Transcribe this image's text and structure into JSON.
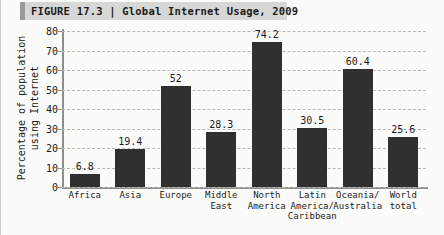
{
  "figure": {
    "title": "FIGURE 17.3 | Global Internet Usage, 2009",
    "title_label": "FIGURE 17.3",
    "title_separator": "|",
    "title_name": "Global Internet Usage, 2009"
  },
  "axis": {
    "ylabel_line1": "Percentage of population",
    "ylabel_line2": "using Internet",
    "yticks": [
      "0",
      "10",
      "20",
      "30",
      "40",
      "50",
      "60",
      "70",
      "80"
    ]
  },
  "colors": {
    "bar": "#303030",
    "grid": "#b9b9b7",
    "axis": "#8e8e8c",
    "title_band": "#d7d7d5",
    "title_accent": "#9a9a98",
    "background": "#fbfbfa",
    "text": "#1b1b1b"
  },
  "chart_data": {
    "type": "bar",
    "title": "Global Internet Usage, 2009",
    "xlabel": "",
    "ylabel": "Percentage of population using Internet",
    "ylim": [
      0,
      80
    ],
    "ytick_step": 10,
    "grid": true,
    "legend": "none",
    "categories": [
      "Africa",
      "Asia",
      "Europe",
      "Middle\nEast",
      "North\nAmerica",
      "Latin\nAmerica/\nCaribbean",
      "Oceania/\nAustralia",
      "World\ntotal"
    ],
    "values": [
      6.8,
      19.4,
      52,
      28.3,
      74.2,
      30.5,
      60.4,
      25.6
    ],
    "value_labels": [
      "6.8",
      "19.4",
      "52",
      "28.3",
      "74.2",
      "30.5",
      "60.4",
      "25.6"
    ]
  }
}
